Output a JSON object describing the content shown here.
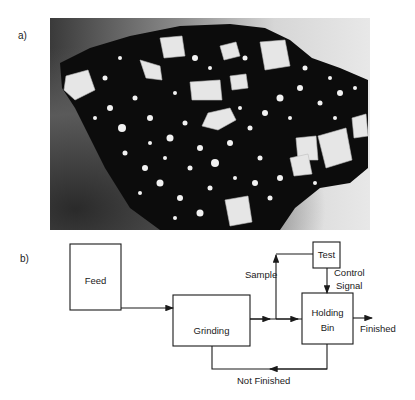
{
  "figure": {
    "panel_a": {
      "label": "a)",
      "photo_description": "micrograph of dark rock matrix with white crystal grains"
    },
    "panel_b": {
      "label": "b)",
      "nodes": {
        "feed": "Feed",
        "grinding": "Grinding",
        "holding_bin_line1": "Holding",
        "holding_bin_line2": "Bin",
        "test": "Test"
      },
      "edge_labels": {
        "sample": "Sample",
        "control_line1": "Control",
        "control_line2": "Signal",
        "finished": "Finished",
        "not_finished": "Not Finished"
      }
    }
  }
}
